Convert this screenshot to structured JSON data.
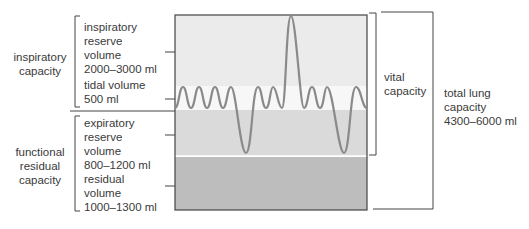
{
  "left_labels": {
    "inspiratory_capacity": [
      "inspiratory",
      "capacity"
    ],
    "functional_residual_capacity": [
      "functional",
      "residual",
      "capacity"
    ]
  },
  "volumes": {
    "irv": [
      "inspiratory",
      "reserve",
      "volume",
      "2000–3000 ml"
    ],
    "tidal": [
      "tidal volume",
      "500 ml"
    ],
    "erv": [
      "expiratory",
      "reserve",
      "volume",
      "800–1200 ml"
    ],
    "rv": [
      "residual",
      "volume",
      "1000–1300 ml"
    ]
  },
  "right_labels": {
    "vital_capacity": [
      "vital",
      "capacity"
    ],
    "total_lung_capacity": [
      "total lung",
      "capacity",
      "4300–6000 ml"
    ]
  },
  "colors": {
    "irv_band": "#ebebeb",
    "tidal_band": "#f7f7f7",
    "erv_band": "#dadada",
    "rv_band": "#bdbdbd",
    "trace": "#8a8a8a",
    "lines": "#444444"
  }
}
